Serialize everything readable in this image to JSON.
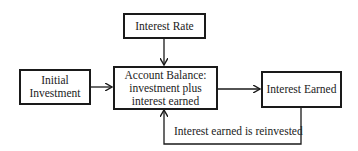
{
  "diagram": {
    "nodes": {
      "interest_rate": {
        "label": "Interest Rate"
      },
      "initial_investment": {
        "line1": "Initial",
        "line2": "Investment"
      },
      "account_balance": {
        "line1": "Account Balance:",
        "line2": "investment plus",
        "line3": "interest earned"
      },
      "interest_earned": {
        "label": "Interest Earned"
      }
    },
    "edges": [
      {
        "from": "interest_rate",
        "to": "account_balance"
      },
      {
        "from": "initial_investment",
        "to": "account_balance"
      },
      {
        "from": "account_balance",
        "to": "interest_earned"
      },
      {
        "from": "interest_earned",
        "to": "account_balance",
        "label": "Interest earned is reinvested"
      }
    ],
    "loop_label": "Interest earned is reinvested"
  }
}
